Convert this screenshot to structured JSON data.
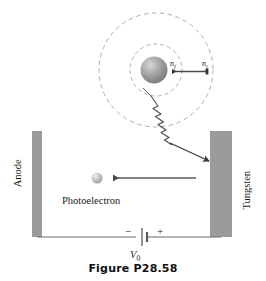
{
  "figure": {
    "caption": "Figure P28.58"
  },
  "atom": {
    "nucleus_color": "#8f8f8f",
    "orbit_stroke": "#b0a9a2",
    "label_n_final": "n",
    "label_n_final_sub": "f",
    "label_n_initial": "n",
    "label_n_initial_sub": "i",
    "transition_arrow_direction": "leftward",
    "photon_name": "emitted-photon"
  },
  "apparatus": {
    "anode_label": "Anode",
    "tungsten_label": "Tungsten",
    "photoelectron_label": "Photoelectron",
    "electron_arrow_direction": "leftward",
    "plate_color": "#9b9b9b",
    "wire_color": "#6b6b6b"
  },
  "circuit": {
    "negative_sign": "−",
    "positive_sign": "+",
    "voltage_label": "V",
    "voltage_sub": "0"
  },
  "colors": {
    "background": "#ffffff",
    "ink": "#1a1a1a",
    "plate": "#9b9b9b",
    "dashed_orbit": "#b3aba3",
    "sphere_light": "#e8e8e8",
    "sphere_dark": "#7d7d7d"
  }
}
